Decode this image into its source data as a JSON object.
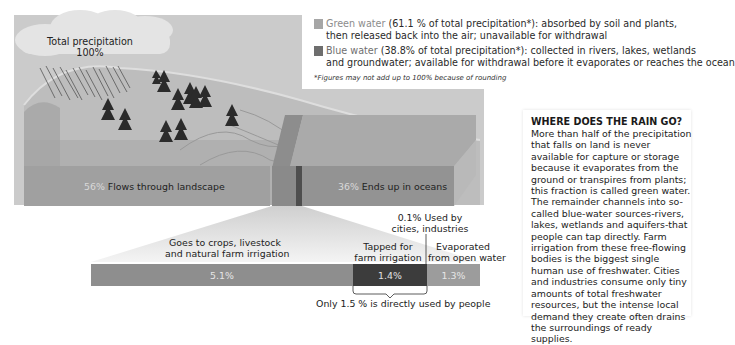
{
  "precipitation": {
    "label": "Total precipitation",
    "value": "100%"
  },
  "legend": {
    "green_water": {
      "name": "Green water",
      "detail_line1": " (61.1 % of total precipitation*): absorbed by soil and plants,",
      "detail_line2": "then released back into the air; unavailable for withdrawal",
      "color": "#a6a6a6"
    },
    "blue_water": {
      "name": "Blue water",
      "detail_line1": " (38.8% of total precipitation*): collected in rivers, lakes, wetlands",
      "detail_line2": "and groundwater; available for withdrawal before it evaporates or reaches the ocean",
      "color": "#7a7a7a"
    },
    "footnote": "*Figures may not add up to 100% because of rounding"
  },
  "landscape": {
    "flows": {
      "pct": "56%",
      "label": "Flows through landscape"
    },
    "oceans": {
      "pct": "36%",
      "label": "Ends up in oceans"
    }
  },
  "breakdown": {
    "crops": {
      "label_line1": "Goes to crops, livestock",
      "label_line2": "and natural farm irrigation",
      "value": "5.1%"
    },
    "farm": {
      "label_line1": "Tapped for",
      "label_line2": "farm irrigation",
      "value": "1.4%"
    },
    "cities": {
      "label_line1": "0.1% Used by",
      "label_line2": "cities, industries"
    },
    "evaporated": {
      "label_line1": "Evaporated",
      "label_line2": "from open water",
      "value": "1.3%"
    },
    "direct_use": "Only 1.5 % is directly used by people"
  },
  "info_panel": {
    "title": "WHERE DOES THE RAIN GO?",
    "body": "More than half of the precipitation that falls on land is never available for capture or storage because it evaporates from the ground or transpires from plants; this fraction is called green water. The remainder channels into so-called blue-water sources-rivers, lakes, wetlands and aquifers-that people can tap directly. Farm irrigation from these free-flowing bodies is the biggest single human use of freshwater. Cities and industries consume only tiny amounts of total freshwater resources, but the intense local demand they create often drains the surroundings of ready supplies."
  },
  "colors": {
    "sky": "#c9c9c9",
    "land": "#b5b5b5",
    "land_front": "#a3a3a3",
    "ocean_top": "#a8a8a8",
    "ocean_front": "#8f8f8f",
    "strip": "#8a8a8a",
    "strip_dark": "#505050",
    "bar_crops": "#8e8e8e",
    "bar_farm": "#3c3c3c",
    "bar_evap": "#9c9c9c"
  }
}
